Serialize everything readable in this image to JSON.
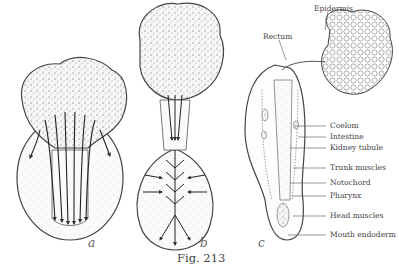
{
  "figure": {
    "caption": "Fig. 213",
    "panels": [
      {
        "letter": "a"
      },
      {
        "letter": "b"
      },
      {
        "letter": "c"
      }
    ],
    "labels": {
      "epidermis": "Epidermis",
      "rectum": "Rectum",
      "coelom": "Coelom",
      "intestine": "Intestine",
      "kidney_tubule": "Kidney tubule",
      "trunk_muscles": "Trunk muscles",
      "notochord": "Notochord",
      "pharynx": "Pharynx",
      "head_muscles": "Head muscles",
      "mouth_endoderm": "Mouth endoderm"
    }
  }
}
